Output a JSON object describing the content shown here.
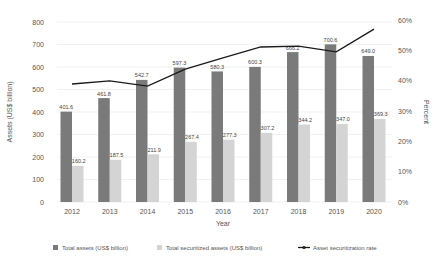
{
  "chart_data": {
    "type": "bar",
    "title": "",
    "xlabel": "Year",
    "ylabel": "Assets (US$ billion)",
    "y2label": "Percent",
    "ylim": [
      0,
      800
    ],
    "y2lim": [
      0,
      60
    ],
    "yticks": [
      0,
      100,
      200,
      300,
      400,
      500,
      600,
      700,
      800
    ],
    "y2ticks": [
      "0%",
      "10%",
      "20%",
      "30%",
      "40%",
      "50%",
      "60%"
    ],
    "grid": true,
    "legend_position": "bottom",
    "categories": [
      "2012",
      "2013",
      "2014",
      "2015",
      "2016",
      "2017",
      "2018",
      "2019",
      "2020"
    ],
    "series": [
      {
        "name": "Total assets (US$ billion)",
        "type": "bar",
        "axis": "left",
        "color": "#7a7a7a",
        "values": [
          401.6,
          461.8,
          542.7,
          597.3,
          580.3,
          600.3,
          666.2,
          700.6,
          649.0
        ],
        "labels": [
          "401.6",
          "461.8",
          "542.7",
          "597.3",
          "580.3",
          "600.3",
          "666.2",
          "700.6",
          "649.0"
        ]
      },
      {
        "name": "Total securitized assets (US$ billion)",
        "type": "bar",
        "axis": "left",
        "color": "#d4d4d4",
        "values": [
          160.2,
          187.5,
          211.9,
          267.4,
          277.3,
          307.2,
          344.2,
          347.0,
          369.3
        ],
        "labels": [
          "160.2",
          "187.5",
          "211.9",
          "267.4",
          "277.3",
          "307.2",
          "344.2",
          "347.0",
          "369.3"
        ]
      },
      {
        "name": "Asset securitization rate",
        "type": "line",
        "axis": "right",
        "color": "#1a1a1a",
        "values": [
          38.9,
          39.9,
          38.2,
          43.8,
          47.5,
          51.1,
          51.4,
          49.5,
          57.0
        ]
      }
    ]
  },
  "legend": {
    "items": [
      {
        "label": "Total assets (US$ billion)",
        "color": "#7a7a7a"
      },
      {
        "label": "Total securitized assets (US$ billion)",
        "color": "#d4d4d4"
      },
      {
        "label": "Asset securitization rate",
        "color": "#1a1a1a"
      }
    ]
  }
}
